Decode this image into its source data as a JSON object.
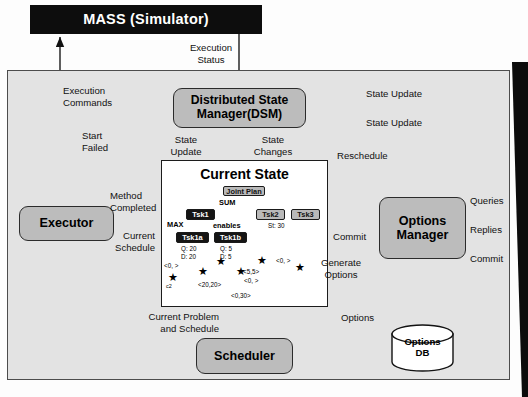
{
  "diagram": {
    "colors": {
      "panel_bg": "#e3e3e3",
      "process_fill": "#bcbcbc",
      "dark_fill": "#0d0d0d",
      "stroke": "#1c1c1c",
      "white": "#ffffff"
    }
  },
  "nodes": {
    "mass": "MASS (Simulator)",
    "dsm_line1": "Distributed State",
    "dsm_line2": "Manager(DSM)",
    "executor": "Executor",
    "options_manager_line1": "Options",
    "options_manager_line2": "Manager",
    "scheduler": "Scheduler",
    "options_db_line1": "Options",
    "options_db_line2": "DB",
    "current_state": "Current State"
  },
  "edge_labels": {
    "execution_status_l1": "Execution",
    "execution_status_l2": "Status",
    "execution_commands_l1": "Execution",
    "execution_commands_l2": "Commands",
    "start_l1": "Start",
    "start_l2": "Failed",
    "method_l1": "Method",
    "method_l2": "Completed",
    "current_schedule_l1": "Current",
    "current_schedule_l2": "Schedule",
    "state_update_left_l1": "State",
    "state_update_left_l2": "Update",
    "state_changes_l1": "State",
    "state_changes_l2": "Changes",
    "state_update_top": "State Update",
    "state_update_bottom": "State Update",
    "reschedule": "Reschedule",
    "queries": "Queries",
    "replies": "Replies",
    "commit_right": "Commit",
    "commit_mid": "Commit",
    "generate_options_l1": "Generate",
    "generate_options_l2": "Options",
    "options": "Options",
    "current_problem_l1": "Current Problem",
    "current_problem_l2": "and Schedule"
  },
  "current_state_detail": {
    "joint_plan": "Joint Plan",
    "sum": "SUM",
    "max": "MAX",
    "enables": "enables",
    "tsk1": "Tsk1",
    "tsk2": "Tsk2",
    "tsk3": "Tsk3",
    "tsk1a": "Tsk1a",
    "tsk1b": "Tsk1b",
    "tsk1a_q": "Q: 20",
    "tsk1a_d": "D: 20",
    "tsk1b_q": "Q: 5",
    "tsk1b_d": "D: 5",
    "st30": "St: 30",
    "c2": "c2",
    "sched_labels": [
      "<0, >",
      "<20,20>",
      "<5,5>",
      "<0, >",
      "<0, >",
      "<0,30>"
    ]
  }
}
